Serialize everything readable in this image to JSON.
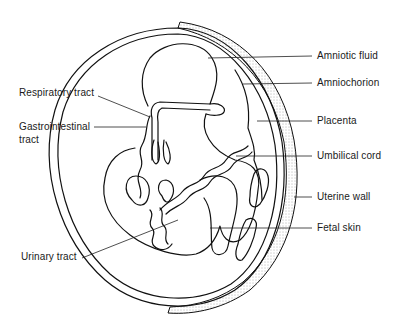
{
  "figure": {
    "colors": {
      "ink": "#111111",
      "stipple": "#555555",
      "background": "#ffffff"
    }
  },
  "labels": {
    "right": [
      {
        "id": "amniotic-fluid",
        "text": "Amniotic fluid"
      },
      {
        "id": "amniochorion",
        "text": "Amniochorion"
      },
      {
        "id": "placenta",
        "text": "Placenta"
      },
      {
        "id": "umbilical-cord",
        "text": "Umbilical cord"
      },
      {
        "id": "uterine-wall",
        "text": "Uterine wall"
      },
      {
        "id": "fetal-skin",
        "text": "Fetal skin"
      }
    ],
    "left": [
      {
        "id": "respiratory-tract",
        "text": "Respiratory tract"
      },
      {
        "id": "gastrointestinal-tract",
        "text": "Gastrointestinal",
        "text2": "tract"
      },
      {
        "id": "urinary-tract",
        "text": "Urinary tract"
      }
    ]
  }
}
